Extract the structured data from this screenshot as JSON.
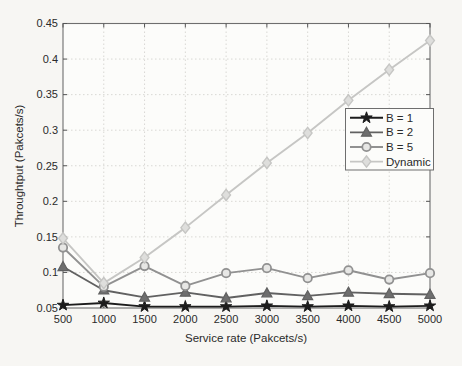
{
  "figure": {
    "background": "#f7f6f3",
    "plot_background": "#fcfcfa",
    "box_color": "#6e6e6e",
    "grid_color": "#d9d8d4",
    "tick_color": "#555555",
    "text_color": "#2a2a2a",
    "legend_background": "#fcfcfa",
    "legend_border": "#6e6e6e"
  },
  "chart_data": {
    "type": "line",
    "title": "",
    "xlabel": "Service rate (Pakcets/s)",
    "ylabel": "Throughtput (Pakcets/s)",
    "x": [
      500,
      1000,
      1500,
      2000,
      2500,
      3000,
      3500,
      4000,
      4500,
      5000
    ],
    "xlim": [
      500,
      5000
    ],
    "ylim": [
      0.05,
      0.45
    ],
    "xticks": [
      500,
      1000,
      1500,
      2000,
      2500,
      3000,
      3500,
      4000,
      4500,
      5000
    ],
    "xtick_labels": [
      "500",
      "1000",
      "1500",
      "2000",
      "2500",
      "3000",
      "3500",
      "4000",
      "4500",
      "5000"
    ],
    "yticks": [
      0.05,
      0.1,
      0.15,
      0.2,
      0.25,
      0.3,
      0.35,
      0.4,
      0.45
    ],
    "ytick_labels": [
      "0.05",
      "0.1",
      "0.15",
      "0.2",
      "0.25",
      "0.3",
      "0.35",
      "0.4",
      "0.45"
    ],
    "grid": true,
    "legend": {
      "position": "middle-right"
    },
    "series": [
      {
        "name": "B = 1",
        "marker": "star",
        "color": "#1c1c1c",
        "marker_fill": "#1c1c1c",
        "values": [
          0.054,
          0.057,
          0.052,
          0.052,
          0.052,
          0.053,
          0.052,
          0.053,
          0.052,
          0.053
        ]
      },
      {
        "name": "B = 2",
        "marker": "triangle",
        "color": "#616161",
        "marker_fill": "#6e6e6e",
        "values": [
          0.108,
          0.075,
          0.065,
          0.072,
          0.064,
          0.071,
          0.067,
          0.072,
          0.07,
          0.069
        ]
      },
      {
        "name": "B = 5",
        "marker": "circle",
        "color": "#919191",
        "marker_fill": "#e7e7e5",
        "values": [
          0.135,
          0.08,
          0.109,
          0.081,
          0.099,
          0.106,
          0.092,
          0.103,
          0.09,
          0.099
        ]
      },
      {
        "name": "Dynamic",
        "marker": "diamond",
        "color": "#c6c6c4",
        "marker_fill": "#dededc",
        "values": [
          0.148,
          0.085,
          0.121,
          0.163,
          0.209,
          0.254,
          0.296,
          0.342,
          0.385,
          0.426
        ]
      }
    ]
  }
}
